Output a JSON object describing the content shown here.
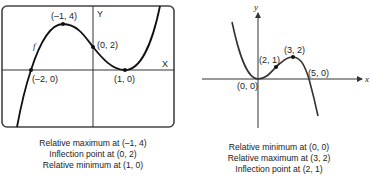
{
  "left": {
    "axis_x_label": "X",
    "axis_y_label": "Y",
    "function_label": "f",
    "points": [
      {
        "label": "(–1, 4)",
        "x": -1,
        "y": 4
      },
      {
        "label": "(0, 2)",
        "x": 0,
        "y": 2
      },
      {
        "label": "(1, 0)",
        "x": 1,
        "y": 0
      },
      {
        "label": "(–2, 0)",
        "x": -2,
        "y": 0
      }
    ],
    "captions": [
      "Relative maximum at (–1, 4)",
      "Inflection point at (0, 2)",
      "Relative minimum at (1, 0)"
    ]
  },
  "right": {
    "axis_x_label": "x",
    "axis_y_label": "y",
    "points": [
      {
        "label": "(0, 0)",
        "x": 0,
        "y": 0
      },
      {
        "label": "(2, 1)",
        "x": 2,
        "y": 1
      },
      {
        "label": "(3, 2)",
        "x": 3,
        "y": 2
      },
      {
        "label": "(5, 0)",
        "x": 5,
        "y": 0
      }
    ],
    "captions": [
      "Relative minimum at (0, 0)",
      "Relative maximum at (3, 2)",
      "Inflection point at (2, 1)"
    ]
  },
  "colors": {
    "curve": "#111111",
    "axis": "#333333",
    "frame": "#444444"
  }
}
